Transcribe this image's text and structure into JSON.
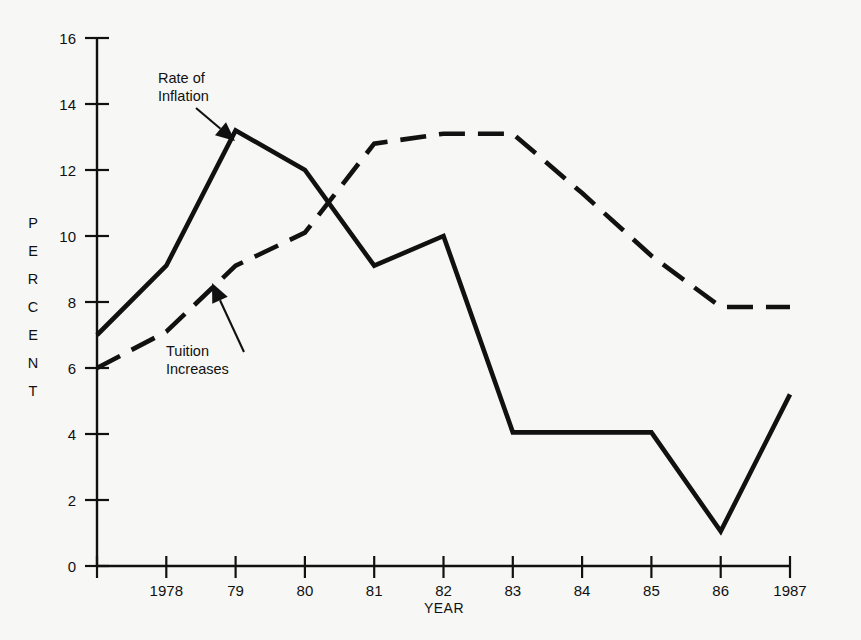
{
  "chart_data": {
    "type": "line",
    "title": "",
    "subtitle": "",
    "xlabel": "YEAR",
    "ylabel": "PERCENT",
    "ylabel_letters": [
      "P",
      "E",
      "R",
      "C",
      "E",
      "N",
      "T"
    ],
    "grid": false,
    "legend_position": "inline-annotations",
    "x": [
      "",
      "1978",
      "79",
      "80",
      "81",
      "82",
      "83",
      "84",
      "85",
      "86",
      "1987"
    ],
    "x_tick_labels": [
      "",
      "1978",
      "79",
      "80",
      "81",
      "82",
      "83",
      "84",
      "85",
      "86",
      "1987"
    ],
    "y_tick_labels": [
      "0",
      "2",
      "4",
      "6",
      "8",
      "10",
      "12",
      "14",
      "16"
    ],
    "y_ticks": [
      0,
      2,
      4,
      6,
      8,
      10,
      12,
      14,
      16
    ],
    "xlim": [
      0,
      10
    ],
    "ylim": [
      0,
      16
    ],
    "series": [
      {
        "name": "Rate of Inflation",
        "style": "solid",
        "color": "#111111",
        "values": [
          7.0,
          9.1,
          13.2,
          12.0,
          9.1,
          10.0,
          4.05,
          4.05,
          4.05,
          1.05,
          5.2
        ]
      },
      {
        "name": "Tuition Increases",
        "style": "dashed",
        "color": "#111111",
        "values": [
          6.0,
          7.1,
          9.1,
          10.1,
          12.8,
          13.1,
          13.1,
          11.3,
          9.4,
          7.85,
          7.85
        ]
      }
    ],
    "annotations": [
      {
        "id": "rate-of-inflation",
        "lines": [
          "Rate of",
          "Inflation"
        ],
        "text_x": 158,
        "text_y": 83,
        "arrow": {
          "x1": 196,
          "y1": 108,
          "x2": 235,
          "y2": 141
        }
      },
      {
        "id": "tuition-increases",
        "lines": [
          "Tuition",
          "Increases"
        ],
        "text_x": 166,
        "text_y": 356,
        "arrow": {
          "x1": 244,
          "y1": 352,
          "x2": 212,
          "y2": 283
        }
      }
    ]
  },
  "axes": {
    "y_axis_name": "percent-axis",
    "x_axis_name": "year-axis"
  },
  "colors": {
    "background": "#f7f7f5",
    "ink": "#111111"
  }
}
